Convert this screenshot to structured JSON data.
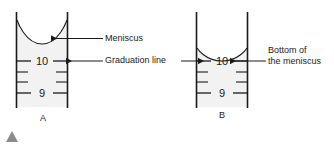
{
  "figure": {
    "type": "diagram",
    "background_color": "#ffffff",
    "line_color": "#1a1a1a",
    "liquid_color": "#f2f2f2",
    "marker_color": "#8c8c8c"
  },
  "cylinders": [
    {
      "id": "A",
      "label": "A",
      "wall_left_x": 16,
      "wall_right_x": 68,
      "top_y": 12,
      "bottom_y": 108,
      "meniscus_bottom_y": 44,
      "meniscus_edge_y": 20,
      "graduations": [
        {
          "value": "10",
          "y": 61,
          "major": true
        },
        {
          "value": "",
          "y": 72,
          "major": false
        },
        {
          "value": "",
          "y": 82,
          "major": false
        },
        {
          "value": "9",
          "y": 93,
          "major": true
        }
      ]
    },
    {
      "id": "B",
      "label": "B",
      "wall_left_x": 196,
      "wall_right_x": 248,
      "top_y": 12,
      "bottom_y": 108,
      "meniscus_bottom_y": 61,
      "meniscus_edge_y": 48,
      "graduations": [
        {
          "value": "10",
          "y": 61,
          "major": true
        },
        {
          "value": "",
          "y": 72,
          "major": false
        },
        {
          "value": "",
          "y": 82,
          "major": false
        },
        {
          "value": "9",
          "y": 93,
          "major": true
        }
      ]
    }
  ],
  "annotations": {
    "meniscus": "Meniscus",
    "graduation_line": "Graduation line",
    "bottom_of_meniscus_line1": "Bottom of",
    "bottom_of_meniscus_line2": "the meniscus"
  },
  "scale_values": {
    "ten": "10",
    "nine": "9"
  }
}
